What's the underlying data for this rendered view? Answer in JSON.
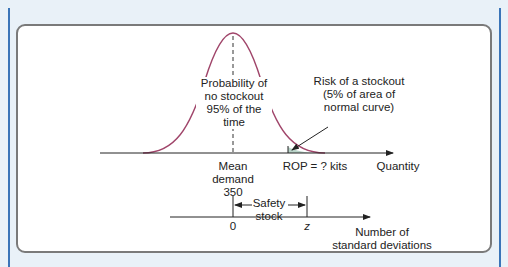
{
  "diagram": {
    "type": "normal-distribution-safety-stock",
    "curve_color": "#a0456a",
    "labels": {
      "center_annotation": "Probability of\nno stockout\n95% of the time",
      "risk_annotation": "Risk of a stockout\n(5% of area of\nnormal curve)",
      "mean_label": "Mean\ndemand\n350",
      "rop_label": "ROP = ? kits",
      "quantity_axis_label": "Quantity",
      "safety_stock_label": "Safety\nstock",
      "zero_label": "0",
      "z_label": "z",
      "sd_axis_label": "Number of\nstandard deviations"
    }
  }
}
